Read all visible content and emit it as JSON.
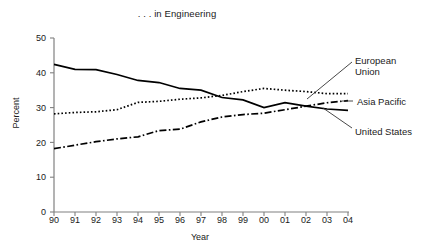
{
  "chart_data": {
    "type": "line",
    "title": ". . . in Engineering",
    "xlabel": "Year",
    "ylabel": "Percent",
    "x": [
      "90",
      "91",
      "92",
      "93",
      "94",
      "95",
      "96",
      "97",
      "98",
      "99",
      "00",
      "01",
      "02",
      "03",
      "04"
    ],
    "categories": [
      "90",
      "91",
      "92",
      "93",
      "94",
      "95",
      "96",
      "97",
      "98",
      "99",
      "00",
      "01",
      "02",
      "03",
      "04"
    ],
    "xlim": [
      0,
      14
    ],
    "ylim": [
      0,
      50
    ],
    "yticks": [
      0,
      10,
      20,
      30,
      40,
      50
    ],
    "ytick_labels": [
      "0",
      "10",
      "20",
      "30",
      "40",
      "50"
    ],
    "xtick_labels": [
      "90",
      "91",
      "92",
      "93",
      "94",
      "95",
      "96",
      "97",
      "98",
      "99",
      "00",
      "01",
      "02",
      "03",
      "04"
    ],
    "grid": false,
    "legend_position": "right-annotations",
    "series": [
      {
        "name": "United States",
        "style": "solid",
        "color": "#000000",
        "values": [
          42.4,
          41.0,
          40.9,
          39.5,
          37.8,
          37.2,
          35.5,
          35.0,
          32.9,
          32.2,
          30.0,
          31.4,
          30.4,
          29.6,
          29.2
        ]
      },
      {
        "name": "European Union",
        "style": "dotted",
        "color": "#000000",
        "values": [
          28.2,
          28.6,
          28.8,
          29.4,
          31.5,
          31.8,
          32.4,
          32.8,
          33.5,
          34.6,
          35.5,
          35.0,
          34.6,
          34.0,
          34.0
        ]
      },
      {
        "name": "Asia Pacific",
        "style": "dash-dot",
        "color": "#000000",
        "values": [
          18.2,
          19.2,
          20.2,
          21.0,
          21.6,
          23.4,
          23.8,
          25.9,
          27.3,
          28.0,
          28.4,
          29.4,
          30.4,
          31.4,
          32.0
        ]
      }
    ],
    "annotations": [
      {
        "label": "European Union",
        "target_series": "European Union",
        "target_x": "02"
      },
      {
        "label": "Asia Pacific",
        "target_series": "Asia Pacific",
        "target_x": "04"
      },
      {
        "label": "United States",
        "target_series": "United States",
        "target_x": "03"
      }
    ]
  },
  "labels": {
    "european_union_line1": "European",
    "european_union_line2": "Union",
    "asia_pacific": "Asia Pacific",
    "united_states": "United States"
  }
}
